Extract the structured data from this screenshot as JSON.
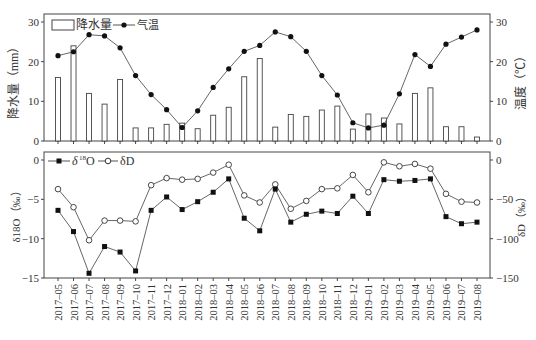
{
  "chart_data": [
    {
      "type": "bar+line",
      "panel": "top",
      "categories": [
        "2017-05",
        "2017-06",
        "2017-07",
        "2017-08",
        "2017-09",
        "2017-10",
        "2017-11",
        "2017-12",
        "2018-01",
        "2018-02",
        "2018-03",
        "2018-04",
        "2018-05",
        "2018-06",
        "2018-07",
        "2018-08",
        "2018-09",
        "2018-10",
        "2018-11",
        "2018-12",
        "2019-01",
        "2019-02",
        "2019-03",
        "2019-04",
        "2019-05",
        "2019-06",
        "2019-07",
        "2019-08"
      ],
      "series": [
        {
          "name": "降水量",
          "type": "bar",
          "axis": "left",
          "values": [
            16.0,
            24.0,
            12.0,
            9.3,
            15.5,
            3.3,
            3.3,
            4.2,
            4.5,
            3.1,
            6.5,
            8.5,
            16.2,
            20.8,
            3.5,
            6.7,
            6.2,
            7.8,
            8.8,
            3.0,
            6.8,
            5.8,
            4.3,
            12.0,
            13.4,
            3.6,
            3.6,
            1.0
          ]
        },
        {
          "name": "气温",
          "type": "line",
          "marker": "filled-circle",
          "axis": "right",
          "values": [
            21.5,
            22.5,
            26.8,
            26.5,
            23.5,
            16.5,
            11.7,
            7.9,
            3.4,
            7.6,
            13.5,
            18.2,
            22.6,
            24.1,
            27.5,
            26.3,
            22.6,
            16.5,
            11.6,
            4.6,
            3.3,
            4.0,
            11.9,
            21.8,
            18.8,
            24.4,
            26.2,
            28.0
          ]
        }
      ],
      "ylabel_left": "降水量（mm）",
      "ylabel_right": "温度（℃）",
      "ylim_left": [
        0,
        30
      ],
      "ylim_right": [
        0,
        30
      ],
      "yticks_left": [
        0,
        10,
        20,
        30
      ],
      "yticks_right": [
        0,
        10,
        20,
        30
      ],
      "legend": [
        "降水量",
        "气温"
      ],
      "legend_position": "upper-left",
      "grid": false
    },
    {
      "type": "line",
      "panel": "bottom",
      "categories": [
        "2017-05",
        "2017-06",
        "2017-07",
        "2017-08",
        "2017-09",
        "2017-10",
        "2017-11",
        "2017-12",
        "2018-01",
        "2018-02",
        "2018-03",
        "2018-04",
        "2018-05",
        "2018-06",
        "2018-07",
        "2018-08",
        "2018-09",
        "2018-10",
        "2018-11",
        "2018-12",
        "2019-01",
        "2019-02",
        "2019-03",
        "2019-04",
        "2019-05",
        "2019-06",
        "2019-07",
        "2019-08"
      ],
      "series": [
        {
          "name": "δ18O",
          "marker": "filled-square",
          "axis": "left",
          "values": [
            -6.4,
            -9.1,
            -14.4,
            -11.0,
            -11.7,
            -14.1,
            -6.4,
            -4.7,
            -6.3,
            -5.3,
            -4.1,
            -2.4,
            -7.4,
            -9.0,
            -3.7,
            -7.9,
            -6.9,
            -6.5,
            -6.8,
            -4.6,
            -6.8,
            -2.5,
            -2.7,
            -2.6,
            -2.4,
            -7.2,
            -8.1,
            -7.9
          ]
        },
        {
          "name": "δD",
          "marker": "open-circle",
          "axis": "right",
          "values": [
            -37,
            -60,
            -102,
            -77,
            -77,
            -78,
            -32,
            -23,
            -25,
            -24,
            -16,
            -6,
            -45,
            -54,
            -31,
            -62,
            -52,
            -37,
            -36,
            -19,
            -41,
            -3,
            -8,
            -5,
            -11,
            -43,
            -53,
            -54
          ]
        }
      ],
      "ylabel_left": "δ18O（‰）",
      "ylabel_right": "δD（‰）",
      "ylim_left": [
        -15,
        0
      ],
      "ylim_right": [
        -150,
        0
      ],
      "yticks_left": [
        -15,
        -10,
        -5,
        0
      ],
      "yticks_right": [
        -150,
        -100,
        -50,
        0
      ],
      "legend": [
        "δ18O",
        "δD"
      ],
      "legend_position": "upper-left",
      "grid": false
    }
  ],
  "labels": {
    "top_legend_bar": "降水量",
    "top_legend_line": "气温",
    "top_ylabel_left": "降水量（mm）",
    "top_ylabel_right": "温度（℃）",
    "bottom_legend_o": "δ",
    "bottom_legend_o_sup": "18",
    "bottom_legend_o_tail": "O",
    "bottom_legend_d": "δD",
    "bottom_ylabel_left": "δ18O（‰）",
    "bottom_ylabel_right": "δD（‰）"
  }
}
